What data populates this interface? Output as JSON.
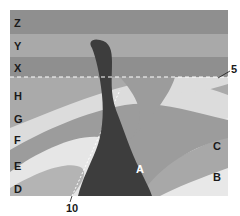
{
  "diagram": {
    "colors": {
      "Z": "#8f8f8f",
      "Y": "#a9a9a9",
      "X": "#8f8f8f",
      "H": "#aaaaaa",
      "G": "#dcdcdc",
      "F": "#9c9c9c",
      "E": "#e6e6e6",
      "D": "#b4b4b4",
      "C": "#a8a8a8",
      "B": "#e8e8e8",
      "A": "#3d3d3d",
      "unconformity": "#ffffff"
    },
    "layer_labels": {
      "Z": "Z",
      "Y": "Y",
      "X": "X",
      "H": "H",
      "G": "G",
      "F": "F",
      "E": "E",
      "D": "D",
      "C": "C",
      "B": "B",
      "A": "A"
    },
    "markers": {
      "unconformity": "5",
      "fault": "10"
    }
  }
}
